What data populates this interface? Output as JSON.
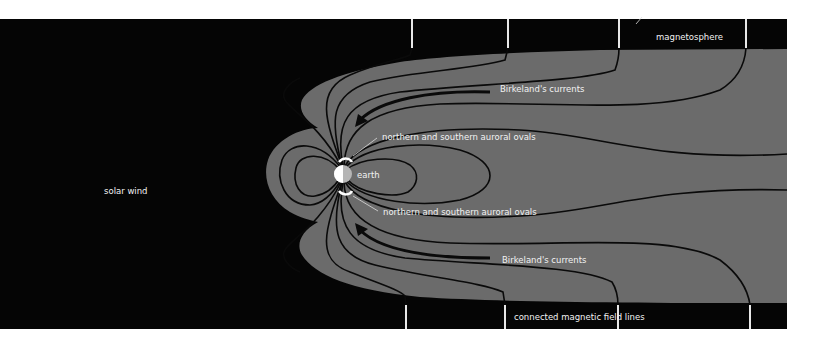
{
  "diagram": {
    "colors": {
      "space": "#050505",
      "magnetosphere": "#6b6b6b",
      "field_line": "#0a0a0a",
      "label": "#f2f2f2",
      "earth_day": "#ffffff",
      "earth_night": "#b5b5b5"
    },
    "labels": {
      "solar_wind": "solar wind",
      "magnetosphere": "magnetosphere",
      "birkeland_top": "Birkeland's currents",
      "birkeland_bottom": "Birkeland's currents",
      "auroral_top": "northern and southern auroral ovals",
      "auroral_bottom": "northern and southern auroral ovals",
      "earth": "earth",
      "connected_lines": "connected magnetic field lines"
    },
    "nodes": [
      {
        "id": "solar-wind",
        "label": "solar wind"
      },
      {
        "id": "magnetosphere",
        "label": "magnetosphere"
      },
      {
        "id": "earth",
        "label": "earth"
      },
      {
        "id": "auroral-ovals",
        "label": "northern and southern auroral ovals"
      },
      {
        "id": "birkeland-currents",
        "label": "Birkeland's currents"
      },
      {
        "id": "connected-field-lines",
        "label": "connected magnetic field lines"
      }
    ]
  }
}
